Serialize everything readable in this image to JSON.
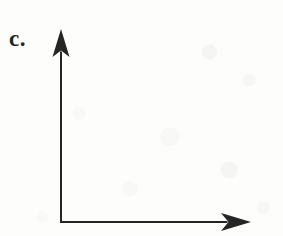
{
  "figure": {
    "panel_label": "c.",
    "background_color": "#fdfdfc",
    "ink_color": "#252525"
  },
  "chart_data": {
    "type": "line",
    "title": "c.",
    "xlabel": "",
    "ylabel": "",
    "series": [],
    "categories": [],
    "values": [],
    "x": [],
    "xlim": [
      0,
      1
    ],
    "ylim": [
      0,
      1
    ],
    "xticks": [],
    "yticks": [],
    "xticklabels": [],
    "yticklabels": [],
    "grid": false,
    "legend": false,
    "legend_position": "none",
    "annotations": [
      {
        "text": "c.",
        "role": "panel-label",
        "x_px": 9,
        "y_px": 27
      }
    ],
    "axes": {
      "origin_px": [
        61,
        222
      ],
      "y_axis": {
        "name": "y-axis",
        "from_px": [
          61,
          222
        ],
        "to_px": [
          61,
          30
        ],
        "arrow": "up",
        "tick_count": 0,
        "labeled": false
      },
      "x_axis": {
        "name": "x-axis",
        "from_px": [
          61,
          222
        ],
        "to_px": [
          250,
          222
        ],
        "arrow": "right",
        "tick_count": 0,
        "labeled": false
      },
      "line_width_px": 2,
      "line_color": "#252525"
    }
  }
}
